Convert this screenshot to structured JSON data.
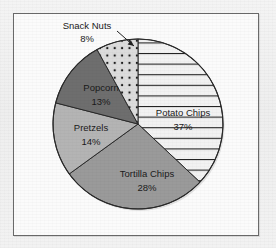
{
  "chart_data": {
    "type": "pie",
    "title": "",
    "subtitle": "",
    "xlabel": "",
    "ylabel": "",
    "legend_position": "none",
    "grid": false,
    "units": "percent",
    "total": 100,
    "categories": [
      "Potato Chips",
      "Tortilla Chips",
      "Pretzels",
      "Popcorn",
      "Snack Nuts"
    ],
    "values": [
      37,
      28,
      14,
      13,
      8
    ],
    "slices": [
      {
        "label": "Potato Chips",
        "value": 37,
        "value_text": "37%",
        "fill_pattern": "horizontal-lines",
        "fill_color": "#f2f2f2",
        "pattern_color": "#1f1f1f",
        "start_angle_deg": 0,
        "end_angle_deg": 133.2,
        "label_placement": "inside"
      },
      {
        "label": "Tortilla Chips",
        "value": 28,
        "value_text": "28%",
        "fill_pattern": "solid",
        "fill_color": "#9a9a9a",
        "pattern_color": "#9a9a9a",
        "start_angle_deg": 133.2,
        "end_angle_deg": 234.0,
        "label_placement": "inside"
      },
      {
        "label": "Pretzels",
        "value": 14,
        "value_text": "14%",
        "fill_pattern": "solid",
        "fill_color": "#b4b4b4",
        "pattern_color": "#b4b4b4",
        "start_angle_deg": 234.0,
        "end_angle_deg": 284.4,
        "label_placement": "inside"
      },
      {
        "label": "Popcorn",
        "value": 13,
        "value_text": "13%",
        "fill_pattern": "solid",
        "fill_color": "#6e6e6e",
        "pattern_color": "#6e6e6e",
        "start_angle_deg": 284.4,
        "end_angle_deg": 331.2,
        "label_placement": "inside"
      },
      {
        "label": "Snack Nuts",
        "value": 8,
        "value_text": "8%",
        "fill_pattern": "dots",
        "fill_color": "#d9d9d9",
        "pattern_color": "#1f1f1f",
        "start_angle_deg": 331.2,
        "end_angle_deg": 360.0,
        "label_placement": "outside-callout"
      }
    ]
  },
  "frame": {
    "border_color": "#6a6a6a",
    "background_color": "#fbfbfb"
  },
  "page": {
    "background_color": "#f1f1f1"
  }
}
